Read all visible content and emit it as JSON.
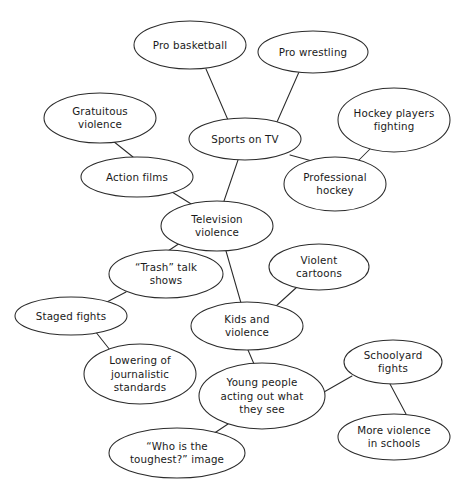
{
  "diagram": {
    "type": "mind-map",
    "width": 463,
    "height": 494,
    "background_color": "#ffffff",
    "stroke_color": "#2b2b2b",
    "text_color": "#1a1a1a",
    "nodes": [
      {
        "id": "pro-basketball",
        "lines": [
          "Pro basketball"
        ],
        "cx": 190,
        "cy": 45,
        "rx": 56,
        "ry": 24
      },
      {
        "id": "pro-wrestling",
        "lines": [
          "Pro wrestling"
        ],
        "cx": 313,
        "cy": 52,
        "rx": 55,
        "ry": 21
      },
      {
        "id": "hockey-players-fighting",
        "lines": [
          "Hockey players",
          "fighting"
        ],
        "cx": 394,
        "cy": 120,
        "rx": 56,
        "ry": 32
      },
      {
        "id": "gratuitous-violence",
        "lines": [
          "Gratuitous",
          "violence"
        ],
        "cx": 100,
        "cy": 118,
        "rx": 56,
        "ry": 25
      },
      {
        "id": "sports-on-tv",
        "lines": [
          "Sports on TV"
        ],
        "cx": 245,
        "cy": 139,
        "rx": 56,
        "ry": 21
      },
      {
        "id": "action-films",
        "lines": [
          "Action films"
        ],
        "cx": 137,
        "cy": 177,
        "rx": 56,
        "ry": 20
      },
      {
        "id": "professional-hockey",
        "lines": [
          "Professional",
          "hockey"
        ],
        "cx": 335,
        "cy": 184,
        "rx": 51,
        "ry": 27
      },
      {
        "id": "television-violence",
        "lines": [
          "Television",
          "violence"
        ],
        "cx": 217,
        "cy": 226,
        "rx": 56,
        "ry": 25
      },
      {
        "id": "trash-talk-shows",
        "lines": [
          "“Trash” talk",
          "shows"
        ],
        "cx": 166,
        "cy": 274,
        "rx": 57,
        "ry": 24
      },
      {
        "id": "violent-cartoons",
        "lines": [
          "Violent",
          "cartoons"
        ],
        "cx": 319,
        "cy": 267,
        "rx": 50,
        "ry": 23
      },
      {
        "id": "staged-fights",
        "lines": [
          "Staged fights"
        ],
        "cx": 71,
        "cy": 316,
        "rx": 56,
        "ry": 19
      },
      {
        "id": "kids-and-violence",
        "lines": [
          "Kids and",
          "violence"
        ],
        "cx": 247,
        "cy": 326,
        "rx": 56,
        "ry": 24
      },
      {
        "id": "lowering-journalistic-standards",
        "lines": [
          "Lowering of",
          "journalistic",
          "standards"
        ],
        "cx": 140,
        "cy": 374,
        "rx": 56,
        "ry": 30
      },
      {
        "id": "young-people-acting-out",
        "lines": [
          "Young people",
          "acting out what",
          "they see"
        ],
        "cx": 262,
        "cy": 396,
        "rx": 63,
        "ry": 33
      },
      {
        "id": "schoolyard-fights",
        "lines": [
          "Schoolyard",
          "fights"
        ],
        "cx": 393,
        "cy": 362,
        "rx": 49,
        "ry": 22
      },
      {
        "id": "more-violence-in-schools",
        "lines": [
          "More violence",
          "in schools"
        ],
        "cx": 394,
        "cy": 437,
        "rx": 56,
        "ry": 23
      },
      {
        "id": "who-is-the-toughest-image",
        "lines": [
          "“Who is the",
          "toughest?” image"
        ],
        "cx": 177,
        "cy": 453,
        "rx": 68,
        "ry": 25
      }
    ],
    "edges": [
      {
        "id": "edge-sports-basketball",
        "from": "sports-on-tv",
        "to": "pro-basketball",
        "x1": 228,
        "y1": 120,
        "x2": 206,
        "y2": 69
      },
      {
        "id": "edge-sports-wrestling",
        "from": "sports-on-tv",
        "to": "pro-wrestling",
        "x1": 277,
        "y1": 122,
        "x2": 299,
        "y2": 72
      },
      {
        "id": "edge-sports-prohockey",
        "from": "sports-on-tv",
        "to": "professional-hockey",
        "x1": 290,
        "y1": 155,
        "x2": 312,
        "y2": 161
      },
      {
        "id": "edge-sports-tvviolence",
        "from": "sports-on-tv",
        "to": "television-violence",
        "x1": 238,
        "y1": 160,
        "x2": 224,
        "y2": 201
      },
      {
        "id": "edge-prohockey-hockeyfighting",
        "from": "professional-hockey",
        "to": "hockey-players-fighting",
        "x1": 356,
        "y1": 163,
        "x2": 371,
        "y2": 148
      },
      {
        "id": "edge-gratuitous-action",
        "from": "gratuitous-violence",
        "to": "action-films",
        "x1": 113,
        "y1": 141,
        "x2": 133,
        "y2": 157
      },
      {
        "id": "edge-action-tvviolence",
        "from": "action-films",
        "to": "television-violence",
        "x1": 172,
        "y1": 192,
        "x2": 196,
        "y2": 207
      },
      {
        "id": "edge-tvviolence-trash",
        "from": "television-violence",
        "to": "trash-talk-shows",
        "x1": 180,
        "y1": 243,
        "x2": 168,
        "y2": 251
      },
      {
        "id": "edge-tvviolence-kids",
        "from": "television-violence",
        "to": "kids-and-violence",
        "x1": 226,
        "y1": 251,
        "x2": 241,
        "y2": 303
      },
      {
        "id": "edge-trash-staged",
        "from": "trash-talk-shows",
        "to": "staged-fights",
        "x1": 126,
        "y1": 292,
        "x2": 105,
        "y2": 303
      },
      {
        "id": "edge-staged-lowering",
        "from": "staged-fights",
        "to": "lowering-journalistic-standards",
        "x1": 95,
        "y1": 331,
        "x2": 110,
        "y2": 350
      },
      {
        "id": "edge-kids-cartoons",
        "from": "kids-and-violence",
        "to": "violent-cartoons",
        "x1": 275,
        "y1": 307,
        "x2": 297,
        "y2": 287
      },
      {
        "id": "edge-kids-youngpeople",
        "from": "kids-and-violence",
        "to": "young-people-acting-out",
        "x1": 248,
        "y1": 350,
        "x2": 254,
        "y2": 364
      },
      {
        "id": "edge-youngpeople-schoolyard",
        "from": "young-people-acting-out",
        "to": "schoolyard-fights",
        "x1": 324,
        "y1": 392,
        "x2": 352,
        "y2": 376
      },
      {
        "id": "edge-youngpeople-toughest",
        "from": "young-people-acting-out",
        "to": "who-is-the-toughest-image",
        "x1": 228,
        "y1": 424,
        "x2": 210,
        "y2": 436
      },
      {
        "id": "edge-schoolyard-moreviolence",
        "from": "schoolyard-fights",
        "to": "more-violence-in-schools",
        "x1": 390,
        "y1": 384,
        "x2": 406,
        "y2": 414
      }
    ]
  }
}
